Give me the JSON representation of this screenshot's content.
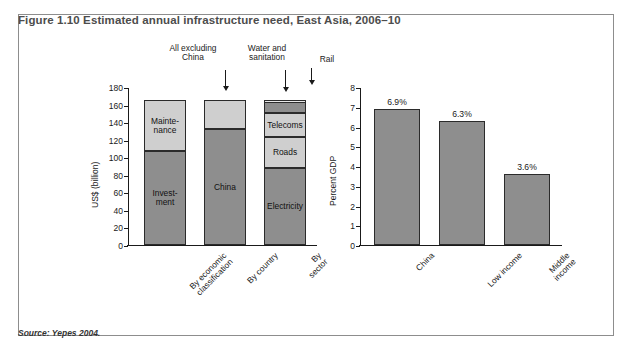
{
  "figure": {
    "title": "Figure 1.10  Estimated annual infrastructure need, East Asia, 2006–10",
    "source": "Source: Yepes 2004."
  },
  "colors": {
    "dark_gray": "#8e8e8e",
    "light_gray": "#cfcfcf",
    "pale_gray": "#e9e9e9",
    "outline": "#2b2b2b",
    "frame": "#8d8d8d",
    "title_text": "#4c4c4c"
  },
  "chart_data": [
    {
      "id": "left",
      "type": "bar",
      "stacked": true,
      "title": "",
      "xlabel": "",
      "ylabel": "US$ (billion)",
      "ylim": [
        0,
        180
      ],
      "ytick_step": 20,
      "yticks": [
        "0",
        "20",
        "40",
        "60",
        "80",
        "100",
        "120",
        "140",
        "160",
        "180"
      ],
      "grid": false,
      "legend": "in-bar labels",
      "categories": [
        "By economic\nclassification",
        "By country",
        "By sector"
      ],
      "bars": [
        {
          "category": "By economic\nclassification",
          "total": 165,
          "segments": [
            {
              "name": "Investment",
              "label": "Invest-\nment",
              "value": 107,
              "from": 0,
              "to": 107,
              "shade": "dark",
              "show_label": true
            },
            {
              "name": "Maintenance",
              "label": "Mainte-\nnance",
              "value": 58,
              "from": 107,
              "to": 165,
              "shade": "light",
              "show_label": true
            }
          ]
        },
        {
          "category": "By country",
          "total": 165,
          "segments": [
            {
              "name": "China",
              "label": "China",
              "value": 132,
              "from": 0,
              "to": 132,
              "shade": "dark",
              "show_label": true
            },
            {
              "name": "All excluding China",
              "label": "",
              "value": 33,
              "from": 132,
              "to": 165,
              "shade": "light",
              "show_label": false
            }
          ]
        },
        {
          "category": "By sector",
          "total": 165,
          "segments": [
            {
              "name": "Electricity",
              "label": "Electricity",
              "value": 88,
              "from": 0,
              "to": 88,
              "shade": "dark",
              "show_label": true
            },
            {
              "name": "Roads",
              "label": "Roads",
              "value": 35,
              "from": 88,
              "to": 123,
              "shade": "light",
              "show_label": true
            },
            {
              "name": "Telecoms",
              "label": "Telecoms",
              "value": 27,
              "from": 123,
              "to": 150,
              "shade": "light",
              "show_label": true
            },
            {
              "name": "Water and sanitation",
              "label": "",
              "value": 13,
              "from": 150,
              "to": 163,
              "shade": "dark",
              "show_label": false
            },
            {
              "name": "Rail",
              "label": "",
              "value": 2,
              "from": 163,
              "to": 165,
              "shade": "pale",
              "show_label": false
            }
          ]
        }
      ],
      "annotations": [
        {
          "text": "All excluding\nChina",
          "target": "All excluding China"
        },
        {
          "text": "Water and\nsanitation",
          "target": "Water and sanitation"
        },
        {
          "text": "Rail",
          "target": "Rail"
        }
      ]
    },
    {
      "id": "right",
      "type": "bar",
      "stacked": false,
      "title": "",
      "xlabel": "",
      "ylabel": "Percent GDP",
      "ylim": [
        0,
        8
      ],
      "ytick_step": 1,
      "yticks": [
        "0",
        "1",
        "2",
        "3",
        "4",
        "5",
        "6",
        "7",
        "8"
      ],
      "grid": false,
      "categories": [
        "China",
        "Low income",
        "Middle income"
      ],
      "values": [
        6.9,
        6.3,
        3.6
      ],
      "value_labels": [
        "6.9%",
        "6.3%",
        "3.6%"
      ]
    }
  ]
}
